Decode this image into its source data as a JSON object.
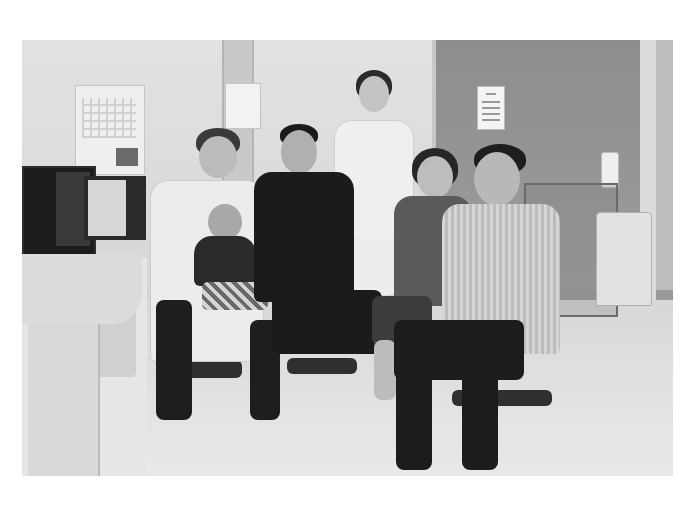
{
  "image": {
    "type": "photograph",
    "color_mode": "grayscale",
    "scene": "doctor's office group portrait",
    "subjects": [
      {
        "id": "doctor",
        "description": "man with glasses in white lab coat, seated, holding baby"
      },
      {
        "id": "baby",
        "description": "infant in dark top and plaid shorts on doctor's lap"
      },
      {
        "id": "young-man",
        "description": "young man in black clothing, seated"
      },
      {
        "id": "nurse",
        "description": "woman with glasses in white uniform with lanyard, standing"
      },
      {
        "id": "older-woman",
        "description": "older woman in dark top, seated"
      },
      {
        "id": "older-man",
        "description": "older man in striped shirt, seated on stool"
      }
    ],
    "objects": [
      "wall calendar",
      "computer monitors",
      "desk",
      "posted notice",
      "medical cart",
      "waste bin",
      "hand sanitizer bottle",
      "office chairs"
    ]
  },
  "colors": {
    "background": "#ffffff",
    "wall": "#dcdcdc",
    "door": "#9a9a9a",
    "floor": "#e2e2e2",
    "dark_clothing": "#1f1f1f",
    "white_coat": "#eeeeee"
  }
}
